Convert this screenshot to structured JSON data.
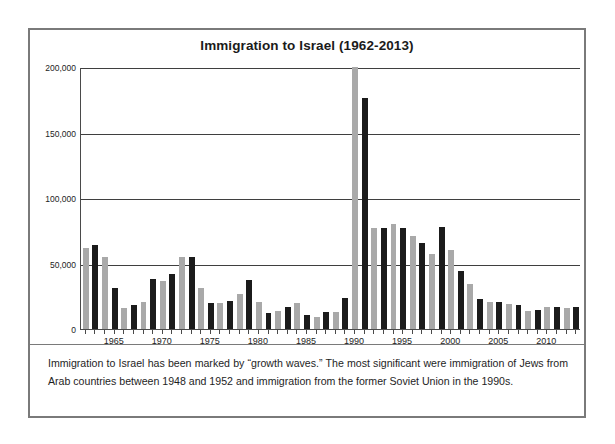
{
  "figure": {
    "title": "Immigration to Israel (1962-2013)",
    "caption": "Immigration to Israel has been marked by “growth waves.” The most significant were immigration of Jews from Arab countries between 1948 and 1952 and immigration from the former Soviet Union in the 1990s.",
    "colors": {
      "bar_gray": "#a9a9a9",
      "bar_black": "#1b1b1b",
      "frame": "#7a7a7a",
      "axis": "#4a4a4a",
      "gridline": "#3f3f3f",
      "background": "#ffffff",
      "text": "#1e1e1e"
    }
  },
  "chart_data": {
    "type": "bar",
    "title": "Immigration to Israel (1962-2013)",
    "xlabel": "",
    "ylabel": "",
    "ylim": [
      0,
      200000
    ],
    "xlim": [
      1962,
      2013
    ],
    "grid": true,
    "legend": "none",
    "ytick_labels": [
      "0",
      "50,000",
      "100,000",
      "150,000",
      "200,000"
    ],
    "ytick_values": [
      0,
      50000,
      100000,
      150000,
      200000
    ],
    "xtick_labels": [
      "1965",
      "1970",
      "1975",
      "1980",
      "1985",
      "1990",
      "1995",
      "2000",
      "2005",
      "2010"
    ],
    "xtick_values": [
      1965,
      1970,
      1975,
      1980,
      1985,
      1990,
      1995,
      2000,
      2005,
      2010
    ],
    "note": "Bars alternate gray and black by year for visual separation. The 1990 bar is clipped at the top of the axis (actual value exceeds 200,000).",
    "categories": [
      1962,
      1963,
      1964,
      1965,
      1966,
      1967,
      1968,
      1969,
      1970,
      1971,
      1972,
      1973,
      1974,
      1975,
      1976,
      1977,
      1978,
      1979,
      1980,
      1981,
      1982,
      1983,
      1984,
      1985,
      1986,
      1987,
      1988,
      1989,
      1990,
      1991,
      1992,
      1993,
      1994,
      1995,
      1996,
      1997,
      1998,
      1999,
      2000,
      2001,
      2002,
      2003,
      2004,
      2005,
      2006,
      2007,
      2008,
      2009,
      2010,
      2011,
      2012,
      2013
    ],
    "values": [
      61500,
      64500,
      55000,
      31000,
      15700,
      18000,
      20700,
      38000,
      37000,
      42000,
      55000,
      55000,
      31500,
      20000,
      19700,
      21400,
      26400,
      37200,
      20400,
      12600,
      13700,
      16900,
      19800,
      10600,
      9500,
      12900,
      13000,
      24000,
      200000,
      176000,
      77000,
      77000,
      80000,
      77000,
      71000,
      66000,
      57000,
      78000,
      60000,
      44000,
      34000,
      23000,
      21000,
      21000,
      19000,
      18000,
      14000,
      14500,
      16500,
      16900,
      16000,
      16500
    ],
    "value_notes": {
      "1990": "Clipped at axis maximum of 200,000",
      "1991": "Approximately 176,000"
    }
  }
}
